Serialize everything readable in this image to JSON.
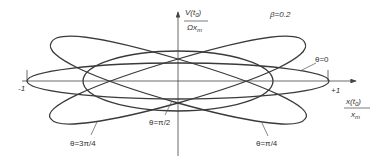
{
  "figure": {
    "parameter_label": "β=0.2",
    "y_axis": {
      "numerator": "V(t",
      "numerator_sub": "0",
      "numerator_end": ")",
      "denominator": "Ωx",
      "denominator_sub": "m"
    },
    "x_axis": {
      "numerator": "x(t",
      "numerator_sub": "0",
      "numerator_end": ")",
      "denominator": "x",
      "denominator_sub": "m"
    },
    "ticks": {
      "left": "-1",
      "right": "+1"
    },
    "curve_labels": {
      "theta_0": "θ=0",
      "theta_pi_2": "θ=π/2",
      "theta_3pi_4": "θ=3π/4",
      "theta_pi_4": "θ=π/4"
    },
    "colors": {
      "curve": "#3a3a3a",
      "axis": "#444444",
      "text": "#333333",
      "background": "#ffffff"
    },
    "curves": [
      {
        "theta": "0",
        "x_amplitude": 1.0,
        "y_half_height": 0.12
      },
      {
        "theta": "π/2",
        "x_amplitude": 0.63,
        "y_half_height": 0.2
      },
      {
        "theta": "π/4",
        "x_amplitude": 0.84,
        "y_half_height": 0.29,
        "tilt": "up-right"
      },
      {
        "theta": "3π/4",
        "x_amplitude": 0.84,
        "y_half_height": 0.29,
        "tilt": "up-left"
      }
    ]
  }
}
